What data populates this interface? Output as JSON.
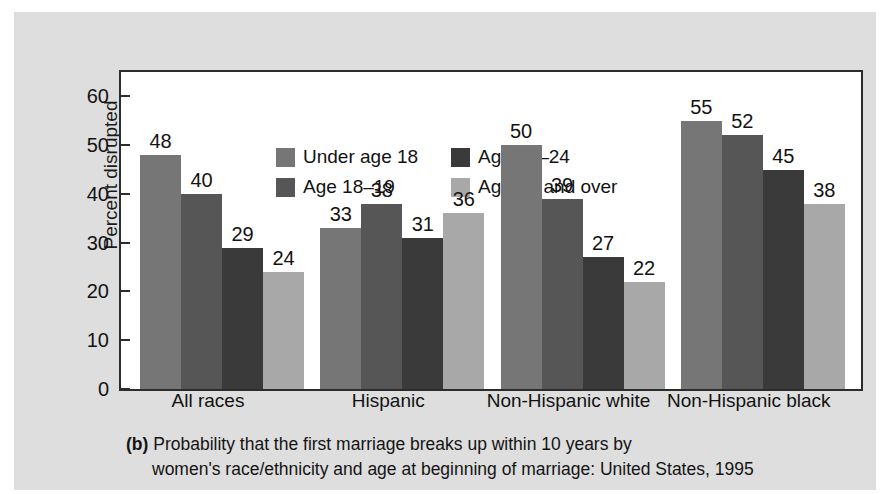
{
  "figure": {
    "panel_color": "#dedede",
    "plot_background": "#ffffff",
    "frame_color": "#2c2c2c"
  },
  "caption": {
    "tag": "(b)",
    "line1": "Probability that the first marriage breaks up within 10 years by",
    "line2": "women's race/ethnicity and age at beginning of marriage: United States, 1995"
  },
  "chart_data": {
    "type": "bar",
    "title": "",
    "xlabel": "",
    "ylabel": "Percent disrupted",
    "ylim": [
      0,
      65
    ],
    "yticks": [
      0,
      10,
      20,
      30,
      40,
      50,
      60
    ],
    "ytick_labels": [
      "0",
      "10",
      "20",
      "30",
      "40",
      "50",
      "60"
    ],
    "grid": false,
    "legend_position": "upper-left-inside",
    "categories": [
      "All races",
      "Hispanic",
      "Non-Hispanic white",
      "Non-Hispanic black"
    ],
    "series": [
      {
        "name": "Under age 18",
        "color": "#767676",
        "values": [
          48,
          33,
          50,
          55
        ]
      },
      {
        "name": "Age 18–19",
        "color": "#565656",
        "values": [
          40,
          38,
          39,
          52
        ]
      },
      {
        "name": "Age 20–24",
        "color": "#3a3a3a",
        "values": [
          29,
          31,
          27,
          45
        ]
      },
      {
        "name": "Age 25 and over",
        "color": "#a8a8a8",
        "values": [
          24,
          36,
          22,
          38
        ]
      }
    ]
  }
}
